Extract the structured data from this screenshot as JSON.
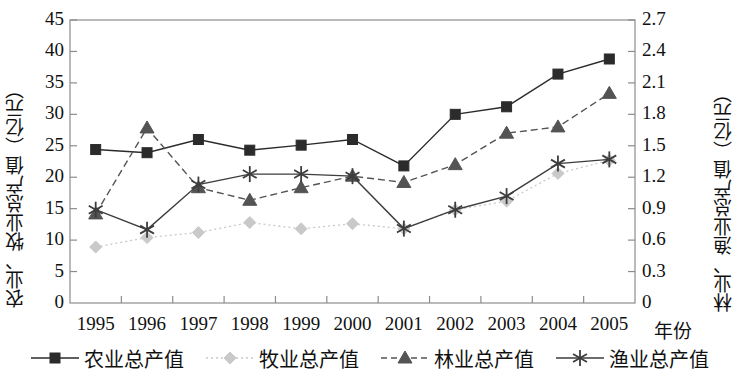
{
  "chart_data": {
    "type": "line",
    "title": "",
    "xlabel": "年份",
    "ylabel": "农业、牧业总产值（亿元）",
    "y2label": "林业、渔业总产值（亿元）",
    "categories": [
      "1995",
      "1996",
      "1997",
      "1998",
      "1999",
      "2000",
      "2001",
      "2002",
      "2003",
      "2004",
      "2005"
    ],
    "ylim": [
      0,
      45
    ],
    "yticks": [
      "0",
      "5",
      "10",
      "15",
      "20",
      "25",
      "30",
      "35",
      "40",
      "45"
    ],
    "y2lim": [
      0,
      2.7
    ],
    "y2ticks": [
      "0",
      "0.3",
      "0.6",
      "0.9",
      "1.2",
      "1.5",
      "1.8",
      "2.1",
      "2.4",
      "2.7"
    ],
    "grid": false,
    "legend_position": "bottom",
    "series": [
      {
        "name": "农业总产值",
        "axis": "left",
        "marker": "square",
        "line_style": "solid",
        "color": "#2b2b2b",
        "values": [
          24.4,
          23.9,
          26.0,
          24.3,
          25.1,
          26.0,
          21.8,
          30.0,
          31.2,
          36.4,
          38.8
        ]
      },
      {
        "name": "牧业总产值",
        "axis": "left",
        "marker": "diamond",
        "line_style": "dotted",
        "color": "#c9c9c9",
        "values": [
          8.9,
          10.4,
          11.2,
          12.8,
          11.8,
          12.6,
          11.8,
          14.8,
          16.2,
          20.6,
          22.7
        ]
      },
      {
        "name": "林业总产值",
        "axis": "right",
        "marker": "triangle",
        "line_style": "dashed",
        "color": "#545454",
        "values": [
          0.85,
          1.67,
          1.1,
          0.98,
          1.1,
          1.21,
          1.15,
          1.32,
          1.62,
          1.68,
          2.0
        ]
      },
      {
        "name": "渔业总产值",
        "axis": "right",
        "marker": "asterisk",
        "line_style": "solid",
        "color": "#3d3d3d",
        "values": [
          0.89,
          0.7,
          1.13,
          1.23,
          1.23,
          1.21,
          0.71,
          0.89,
          1.02,
          1.33,
          1.37
        ]
      }
    ]
  },
  "legend": {
    "items": [
      {
        "label": "农业总产值"
      },
      {
        "label": "牧业总产值"
      },
      {
        "label": "林业总产值"
      },
      {
        "label": "渔业总产值"
      }
    ]
  }
}
